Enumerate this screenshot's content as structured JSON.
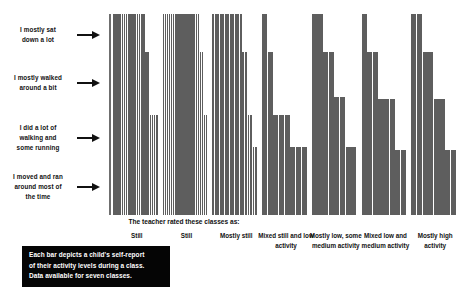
{
  "y_annotations": [
    {
      "name": "sat-down-a-lot",
      "lines": [
        "I mostly sat",
        "down a lot"
      ]
    },
    {
      "name": "walked-around-a-bit",
      "lines": [
        "I mostly walked",
        "around a bit"
      ]
    },
    {
      "name": "walking-some-running",
      "lines": [
        "I did a lot of",
        "walking and",
        "some running"
      ]
    },
    {
      "name": "moved-and-ran",
      "lines": [
        "I moved and ran",
        "around most of",
        "the time"
      ]
    }
  ],
  "x_axis_title": "The teacher rated these classes as:",
  "caption": {
    "lines": [
      "Each bar depicts a child's self-report",
      "of their activity levels during a class.",
      "Data available for seven classes."
    ]
  },
  "colors": {
    "bar": "#5e5e5e",
    "axis": "#6f6f6f",
    "caption_background": "#050505",
    "caption_text": "#ffffff",
    "text": "#111111",
    "page_background": "#ffffff"
  },
  "chart_data": {
    "type": "bar",
    "title": "",
    "xlabel": "The teacher rated these classes as:",
    "ylabel": "",
    "ylim": [
      0,
      4
    ],
    "grid": false,
    "legend": "none",
    "y_tick_labels": [
      "I moved and ran around most of the time",
      "I did a lot of walking and some running",
      "I mostly walked around a bit",
      "I mostly sat down a lot"
    ],
    "categories": [
      "Still",
      "Still",
      "Mostly still",
      "Mixed still and low activity",
      "Mostly low, some medium activity",
      "Mixed low and medium activity",
      "Mostly high activity"
    ],
    "note": "Each bar is one child's self-report of activity level within a class; bars sorted descending within each class group.",
    "groups": [
      {
        "category": "Still",
        "values": [
          4,
          4,
          4,
          4,
          4,
          4,
          4,
          4,
          4,
          4,
          4,
          4,
          4,
          4,
          4,
          3.25,
          3.25,
          2.0,
          2.0,
          2.0,
          2.0
        ]
      },
      {
        "category": "Still",
        "values": [
          4,
          4,
          4,
          4,
          4,
          4,
          4,
          4,
          4,
          4,
          4,
          4,
          4,
          4,
          4,
          4,
          4,
          4,
          3.25,
          3.25,
          2.0,
          2.0
        ]
      },
      {
        "category": "Mostly still",
        "values": [
          4,
          4,
          4,
          4,
          4,
          4,
          4,
          4,
          4,
          4,
          4,
          4,
          3.25,
          3.25,
          2.0,
          2.0,
          1.35,
          1.35
        ]
      },
      {
        "category": "Mixed still and low activity",
        "values": [
          4,
          3.25,
          2.0,
          2.0,
          2.0,
          1.35,
          1.35,
          1.35
        ]
      },
      {
        "category": "Mostly low, some medium activity",
        "values": [
          4,
          4,
          3.25,
          3.25,
          2.35,
          2.35,
          1.35,
          1.35
        ]
      },
      {
        "category": "Mixed low and medium activity",
        "values": [
          4,
          3.25,
          3.25,
          2.3,
          2.3,
          2.3,
          1.3,
          1.3
        ]
      },
      {
        "category": "Mostly high activity",
        "values": [
          4,
          4,
          3.25,
          3.25,
          2.3,
          2.3,
          1.3,
          1.3
        ]
      }
    ]
  }
}
